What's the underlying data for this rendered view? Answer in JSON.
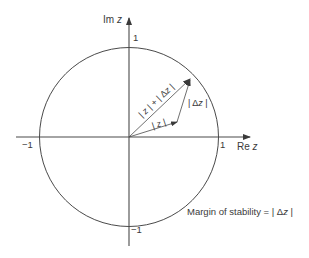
{
  "diagram": {
    "axes": {
      "x_label_prefix": "Re ",
      "x_label_var": "z",
      "y_label_prefix": "Im ",
      "y_label_var": "z"
    },
    "ticks": {
      "x_pos": "1",
      "x_neg": "−1",
      "y_pos": "1",
      "y_neg": "−1"
    },
    "circle": {
      "type": "unit circle",
      "radius": 1
    },
    "vectors": {
      "z": {
        "label_open": "| ",
        "label_var": "z",
        "label_close": " |"
      },
      "delta_z": {
        "label_open": "| Δ",
        "label_var": "z",
        "label_close": " |"
      },
      "sum": {
        "label_part1": "| ",
        "label_var1": "z",
        "label_part2": " | + | Δ",
        "label_var2": "z",
        "label_part3": " |"
      }
    },
    "caption": {
      "text_prefix": "Margin of stability = | Δ",
      "text_var": "z",
      "text_suffix": " |"
    },
    "colors": {
      "line": "#4a4a4a",
      "background": "#ffffff",
      "text": "#3a3a3a"
    }
  }
}
